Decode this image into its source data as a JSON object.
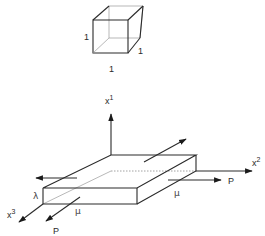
{
  "unit_cube": {
    "height_label": "1",
    "depth_label": "1",
    "width_label": "1"
  },
  "axes": {
    "x1": {
      "base": "x",
      "superscript": "1"
    },
    "x2": {
      "base": "x",
      "superscript": "2"
    },
    "x3": {
      "base": "x",
      "superscript": "3"
    }
  },
  "labels": {
    "lambda": "λ",
    "mu_front": "μ",
    "mu_right": "μ",
    "force_right": "P",
    "force_front": "P"
  },
  "colors": {
    "line": "#2a2a2a",
    "hidden_line": "#8a8a8a",
    "background": "#ffffff"
  }
}
